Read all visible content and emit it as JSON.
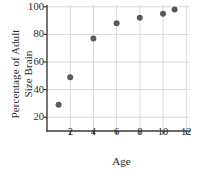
{
  "chart_data": {
    "type": "scatter",
    "title": "",
    "xlabel": "Age",
    "ylabel_line1": "Percentage of Adult",
    "ylabel_line2": "Size Brain",
    "x": [
      1,
      2,
      4,
      6,
      8,
      10,
      11
    ],
    "values": [
      29,
      49,
      77,
      88,
      92,
      95,
      98
    ],
    "points": [
      {
        "x": 1,
        "y": 29
      },
      {
        "x": 2,
        "y": 49
      },
      {
        "x": 4,
        "y": 77
      },
      {
        "x": 6,
        "y": 88
      },
      {
        "x": 8,
        "y": 92
      },
      {
        "x": 10,
        "y": 95
      },
      {
        "x": 11,
        "y": 98
      }
    ],
    "xlim": [
      0,
      12
    ],
    "ylim": [
      10,
      100
    ],
    "xticks": [
      2,
      4,
      6,
      8,
      10,
      12
    ],
    "xtick_labels": [
      "2",
      "4",
      "6",
      "8",
      "10",
      "12"
    ],
    "yticks": [
      20,
      40,
      60,
      80,
      100
    ],
    "ytick_labels": [
      "20",
      "40",
      "60",
      "80",
      "100"
    ],
    "grid": true,
    "legend": null,
    "marker_color": "#5a5a5a",
    "grid_color": "#cfcfcf",
    "axis_color": "#3a3a3a",
    "background_color": "#ffffff"
  }
}
